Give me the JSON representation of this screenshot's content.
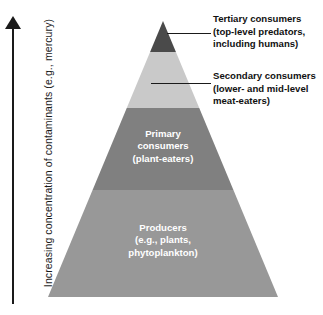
{
  "diagram": {
    "axis": {
      "label": "Increasing concentration of contaminants (e.g., mercury)",
      "direction": "up",
      "arrow_icon": "up-arrow-icon"
    },
    "tiers": [
      {
        "id": "tertiary",
        "name": "Tertiary consumers",
        "line1": "Tertiary consumers",
        "line2": "(top-level predators,",
        "line3": "including humans)",
        "color": "#4a4a4a",
        "position": "apex",
        "label_placement": "callout-right"
      },
      {
        "id": "secondary",
        "name": "Secondary consumers",
        "line1": "Secondary consumers",
        "line2": "(lower- and mid-level",
        "line3": "meat-eaters)",
        "color": "#c9c9c9",
        "position": "upper",
        "label_placement": "callout-right"
      },
      {
        "id": "primary",
        "name": "Primary consumers",
        "line1": "Primary",
        "line2": "consumers",
        "line3": "(plant-eaters)",
        "color": "#808080",
        "position": "middle",
        "label_placement": "inside"
      },
      {
        "id": "producers",
        "name": "Producers",
        "line1": "Producers",
        "line2": "(e.g., plants,",
        "line3": "phytoplankton)",
        "color": "#989898",
        "position": "base",
        "label_placement": "inside"
      }
    ],
    "colors": {
      "background": "#ffffff",
      "axis": "#1a1a1a",
      "leader_line": "#1a1a1a",
      "inside_label_text": "#ffffff",
      "callout_text": "#111111"
    }
  }
}
